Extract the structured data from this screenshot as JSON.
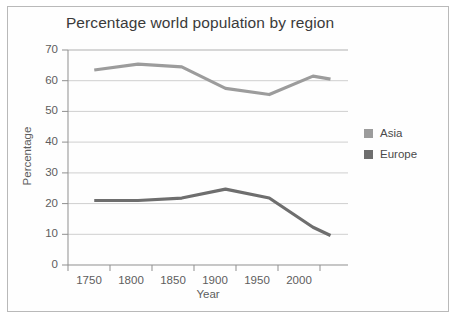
{
  "chart_data": {
    "type": "line",
    "title": "Percentage world population by region",
    "xlabel": "Year",
    "ylabel": "Percentage",
    "xlim": [
      1720,
      2040
    ],
    "ylim": [
      0,
      70
    ],
    "xticks": [
      1750,
      1800,
      1850,
      1900,
      1950,
      2000
    ],
    "yticks": [
      0,
      10,
      20,
      30,
      40,
      50,
      60,
      70
    ],
    "grid": true,
    "legend_position": "right",
    "x": [
      1750,
      1800,
      1850,
      1900,
      1950,
      2000,
      2020
    ],
    "series": [
      {
        "name": "Asia",
        "color": "#9c9c9c",
        "values": [
          63.5,
          65.4,
          64.5,
          57.5,
          55.5,
          61.5,
          60.5
        ]
      },
      {
        "name": "Europe",
        "color": "#6e6e6e",
        "values": [
          21,
          21,
          21.8,
          24.7,
          21.8,
          12.3,
          9.6
        ]
      }
    ]
  },
  "legend": {
    "items": [
      {
        "label": "Asia",
        "color": "#9c9c9c"
      },
      {
        "label": "Europe",
        "color": "#6e6e6e"
      }
    ]
  },
  "axis": {
    "y_tick_labels": [
      "70",
      "60",
      "50",
      "40",
      "30",
      "20",
      "10",
      "0"
    ],
    "x_tick_labels": [
      "1750",
      "1800",
      "1850",
      "1900",
      "1950",
      "2000"
    ]
  }
}
